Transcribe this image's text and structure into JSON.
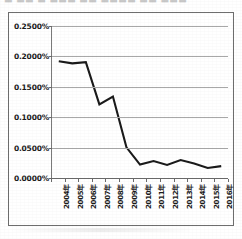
{
  "title_ghost": "▬ ▬▬ ▬ ▬▬▬ ▬▬ ▬▬▬▬ ▬▬ ▬▬▬",
  "chart_data": {
    "type": "line",
    "title": "",
    "subtitle": "",
    "xlabel": "",
    "ylabel": "",
    "categories": [
      "2004年",
      "2005年",
      "2006年",
      "2007年",
      "2008年",
      "2009年",
      "2010年",
      "2011年",
      "2012年",
      "2013年",
      "2014年",
      "2015年",
      "2016年"
    ],
    "values": [
      0.192,
      0.1885,
      0.1905,
      0.121,
      0.134,
      0.0505,
      0.022,
      0.028,
      0.0215,
      0.0295,
      0.024,
      0.0165,
      0.0195
    ],
    "value_unit": "%",
    "ytick_labels": [
      "0.2500%",
      "0.2000%",
      "0.1500%",
      "0.1000%",
      "0.0500%",
      "0.0000%"
    ],
    "ytick_values": [
      0.25,
      0.2,
      0.15,
      0.1,
      0.05,
      0.0
    ],
    "ylim": [
      0.0,
      0.25
    ],
    "grid": true,
    "grid_axis": "y",
    "legend": false,
    "legend_position": "none",
    "series_color": "#1a1a1a",
    "gridline_color": "#a8a8a8",
    "plot_background": "#ffffff",
    "frame_color": "#6e6e6e",
    "annotations": []
  }
}
